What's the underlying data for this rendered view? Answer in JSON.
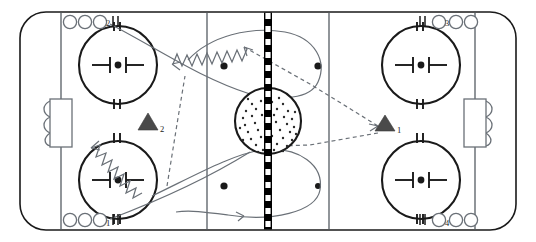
{
  "diagram": {
    "type": "hockey-rink-play-diagram",
    "colors": {
      "ice": "#ffffff",
      "boards": "#1a1a1a",
      "zone_line": "#555c63",
      "center_line": "#000000",
      "center_line_dash": "#ffffff",
      "marking": "#1a1a1a",
      "path": "#6a7077",
      "triangle": "#4a4a4a"
    },
    "rink": {
      "board_left": 20,
      "board_top": 12,
      "board_width": 496,
      "board_height": 218,
      "corner_radius": 26
    },
    "lines": {
      "goal_line_left_x": 61,
      "goal_line_right_x": 475,
      "blue_line_left_x": 207,
      "blue_line_right_x": 329,
      "center_line_x": 268
    },
    "groups": [
      {
        "name": "group-2",
        "label": "2",
        "corner": "top-left",
        "player_count": 3,
        "tally_marks": 2
      },
      {
        "name": "group-1",
        "label": "1",
        "corner": "bottom-left",
        "player_count": 3,
        "tally_marks": 2
      },
      {
        "name": "group-3",
        "label": "3",
        "corner": "top-right",
        "player_count": 3,
        "tally_marks": 2
      },
      {
        "name": "group-4",
        "label": "4",
        "corner": "bottom-right",
        "player_count": 3,
        "tally_marks": 2
      }
    ],
    "cones": [
      {
        "name": "cone-2",
        "label": "2",
        "x": 148,
        "y": 128
      },
      {
        "name": "cone-1",
        "label": "1",
        "x": 385,
        "y": 130
      }
    ],
    "faceoff_circles": [
      {
        "name": "faceoff-circle-top-left",
        "cx": 118,
        "cy": 65,
        "r": 39
      },
      {
        "name": "faceoff-circle-bottom-left",
        "cx": 118,
        "cy": 180,
        "r": 39
      },
      {
        "name": "faceoff-circle-top-right",
        "cx": 421,
        "cy": 65,
        "r": 39
      },
      {
        "name": "faceoff-circle-bottom-right",
        "cx": 421,
        "cy": 180,
        "r": 39
      }
    ],
    "neutral_dots": [
      {
        "name": "neutral-dot-top-left",
        "cx": 224,
        "cy": 66
      },
      {
        "name": "neutral-dot-top-right",
        "cx": 318,
        "cy": 66
      },
      {
        "name": "neutral-dot-bottom-left",
        "cx": 224,
        "cy": 186
      },
      {
        "name": "neutral-dot-bottom-right",
        "cx": 318,
        "cy": 186
      }
    ],
    "center_circle": {
      "name": "center-faceoff-circle",
      "cx": 268,
      "cy": 121,
      "r": 33,
      "stipple_count": 46
    },
    "goals": [
      {
        "name": "goal-left",
        "x": 50,
        "y": 99,
        "width": 22,
        "height": 48
      },
      {
        "name": "goal-right",
        "x": 464,
        "y": 99,
        "width": 22,
        "height": 48
      }
    ],
    "legend_note": "Solid curved lines = skating routes; zig-zag lines = puck carry; dashed lines = passes"
  }
}
